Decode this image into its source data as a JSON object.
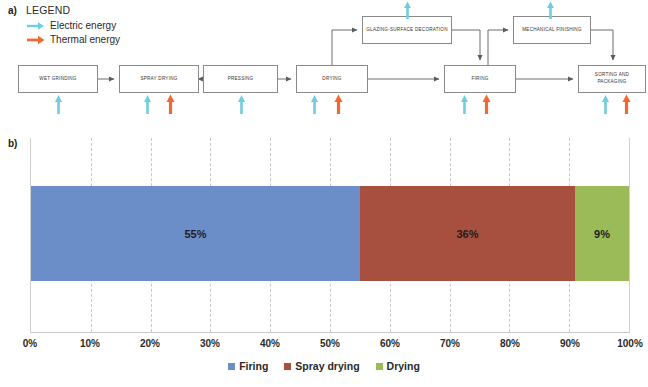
{
  "panel_a": {
    "tag": "a)",
    "legend": {
      "title": "LEGEND",
      "items": [
        {
          "label": "Electric energy",
          "icon": "arrow-right-icon",
          "color": "#6ecde0"
        },
        {
          "label": "Thermal energy",
          "icon": "arrow-right-icon",
          "color": "#ef6a33"
        }
      ]
    },
    "process_boxes": [
      {
        "id": "wet-grinding",
        "label": "WET GRINDING",
        "x": 18,
        "y": 65,
        "w": 80,
        "h": 28,
        "energy": [
          "electric"
        ]
      },
      {
        "id": "spray-drying",
        "label": "SPRAY DRYING",
        "x": 119,
        "y": 65,
        "w": 80,
        "h": 28,
        "energy": [
          "electric",
          "thermal"
        ]
      },
      {
        "id": "pressing",
        "label": "PRESSING",
        "x": 203,
        "y": 65,
        "w": 75,
        "h": 28,
        "energy": [
          "electric"
        ]
      },
      {
        "id": "drying",
        "label": "DRYING",
        "x": 296,
        "y": 65,
        "w": 72,
        "h": 28,
        "energy": [
          "electric",
          "thermal"
        ]
      },
      {
        "id": "firing",
        "label": "FIRING",
        "x": 444,
        "y": 65,
        "w": 72,
        "h": 28,
        "energy": [
          "electric",
          "thermal"
        ]
      },
      {
        "id": "sorting-packaging",
        "label": "SORTING AND PACKAGING",
        "x": 578,
        "y": 65,
        "w": 68,
        "h": 28,
        "energy": [
          "electric",
          "thermal"
        ]
      },
      {
        "id": "glazing-decoration",
        "label": "GLAZING-SURFACE DECORATION",
        "x": 362,
        "y": 16,
        "w": 90,
        "h": 28,
        "energy": [
          "electric"
        ]
      },
      {
        "id": "mechanical-finishing",
        "label": "MECHANICAL FINISHING",
        "x": 513,
        "y": 16,
        "w": 78,
        "h": 28,
        "energy": [
          "electric"
        ]
      }
    ]
  },
  "panel_b": {
    "tag": "b)"
  },
  "chart_data": {
    "type": "bar",
    "orientation": "horizontal",
    "stacked": true,
    "title": "",
    "xlabel": "",
    "ylabel": "",
    "xlim": [
      0,
      100
    ],
    "grid": true,
    "legend_position": "bottom",
    "categories": [
      ""
    ],
    "tick_labels": [
      "0%",
      "10%",
      "20%",
      "30%",
      "40%",
      "50%",
      "60%",
      "70%",
      "80%",
      "90%",
      "100%"
    ],
    "tick_values": [
      0,
      10,
      20,
      30,
      40,
      50,
      60,
      70,
      80,
      90,
      100
    ],
    "series": [
      {
        "name": "Firing",
        "values": [
          55
        ],
        "label": "55%",
        "color": "#6b8ec9"
      },
      {
        "name": "Spray drying",
        "values": [
          36
        ],
        "label": "36%",
        "color": "#a8503f"
      },
      {
        "name": "Drying",
        "values": [
          9
        ],
        "label": "9%",
        "color": "#9bbb59"
      }
    ]
  }
}
